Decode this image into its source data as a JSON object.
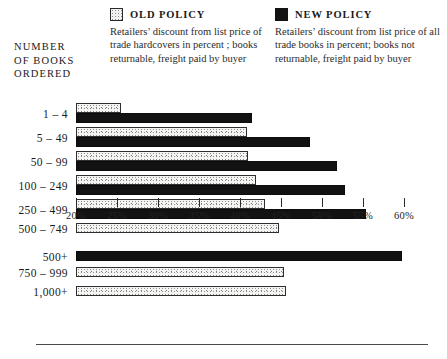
{
  "axis_title": "NUMBER\nOF BOOKS\nORDERED",
  "legend": {
    "old": {
      "swatch_name": "old-policy-swatch",
      "title": "OLD POLICY",
      "description": "Retailers’ discount from list price of trade hardcovers in percent ; books returnable, freight paid by buyer"
    },
    "new": {
      "swatch_name": "new-policy-swatch",
      "title": "NEW POLICY",
      "description": "Retailers’ discount from list price of all trade books in percent; books not returnable, freight paid by buyer"
    }
  },
  "chart_data": {
    "type": "bar",
    "orientation": "horizontal",
    "title": "",
    "xlabel": "",
    "ylabel": "NUMBER OF BOOKS ORDERED",
    "xlim": [
      20,
      60
    ],
    "grid": false,
    "legend_position": "top",
    "tick_labels": [
      "20%",
      "25%",
      "30%",
      "35%",
      "40%",
      "45%",
      "50%",
      "55%",
      "60%"
    ],
    "ticks": [
      20,
      25,
      30,
      35,
      40,
      45,
      50,
      55,
      60
    ],
    "categories": [
      "1  –  4",
      "5 – 49",
      "50 – 99",
      "100 – 249",
      "250 – 499",
      "500 – 749",
      "500+",
      "750 – 999",
      "1,000+"
    ],
    "series": [
      {
        "name": "OLD POLICY",
        "color": "#f4f4f2",
        "values": [
          25.5,
          40.8,
          41.0,
          42.0,
          43.0,
          44.8,
          null,
          45.4,
          45.6
        ]
      },
      {
        "name": "NEW POLICY",
        "color": "#121212",
        "values": [
          41.5,
          48.5,
          51.8,
          52.8,
          55.4,
          null,
          59.7,
          null,
          null
        ]
      }
    ]
  }
}
